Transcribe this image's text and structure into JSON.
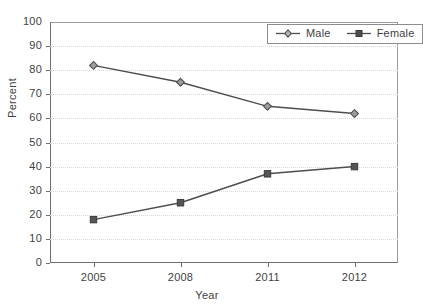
{
  "chart_data": {
    "type": "line",
    "title": "",
    "subtitle": "",
    "xlabel": "Year",
    "ylabel": "Percent",
    "categories": [
      "2005",
      "2008",
      "2011",
      "2012"
    ],
    "x": [
      "2005",
      "2008",
      "2011",
      "2012"
    ],
    "ylim": [
      0,
      100
    ],
    "ytick_labels": [
      "0",
      "10",
      "20",
      "30",
      "40",
      "50",
      "60",
      "70",
      "80",
      "90",
      "100"
    ],
    "ytick_values": [
      0,
      10,
      20,
      30,
      40,
      50,
      60,
      70,
      80,
      90,
      100
    ],
    "grid": "horizontal-dotted",
    "legend_position": "top-right",
    "series": [
      {
        "name": "Male",
        "values": [
          82,
          75,
          65,
          62
        ],
        "marker": "diamond-open",
        "color": "#4d4d4d"
      },
      {
        "name": "Female",
        "values": [
          18,
          25,
          37,
          40
        ],
        "marker": "square-filled",
        "color": "#4d4d4d"
      }
    ]
  },
  "legend": {
    "items": [
      {
        "label": "Male",
        "marker": "diamond-open-marker"
      },
      {
        "label": "Female",
        "marker": "square-filled-marker"
      }
    ]
  },
  "colors": {
    "line": "#4d4d4d",
    "axis": "#6e6e6e",
    "grid": "#d9d9d9",
    "text": "#3f3f3f",
    "marker_fill_male": "#9e9e9e",
    "marker_fill_female": "#555555",
    "background": "#ffffff"
  }
}
